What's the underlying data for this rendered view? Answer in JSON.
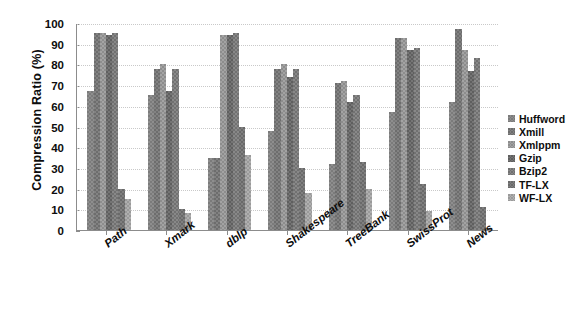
{
  "chart_data": {
    "type": "bar",
    "title": "",
    "xlabel": "",
    "ylabel": "Compression Ratio (%)",
    "ylim": [
      0,
      100
    ],
    "yticks": [
      0,
      10,
      20,
      30,
      40,
      50,
      60,
      70,
      80,
      90,
      100
    ],
    "grid": true,
    "legend_position": "right",
    "categories": [
      "Path",
      "Xmark",
      "dblp",
      "Shakespeare",
      "TreeBank",
      "SwissProt",
      "News"
    ],
    "series": [
      {
        "name": "Huffword",
        "values": [
          67,
          65,
          35,
          48,
          32,
          57,
          62
        ]
      },
      {
        "name": "Xmill",
        "values": [
          95,
          78,
          35,
          78,
          71,
          93,
          97
        ]
      },
      {
        "name": "Xmlppm",
        "values": [
          95,
          80,
          94,
          80,
          72,
          93,
          87
        ]
      },
      {
        "name": "Gzip",
        "values": [
          94,
          67,
          94,
          74,
          62,
          87,
          77
        ]
      },
      {
        "name": "Bzip2",
        "values": [
          95,
          78,
          95,
          78,
          65,
          88,
          83
        ]
      },
      {
        "name": "TF-LX",
        "values": [
          20,
          10,
          50,
          30,
          33,
          22,
          11
        ]
      },
      {
        "name": "WF-LX",
        "values": [
          15,
          8,
          36,
          18,
          20,
          9,
          1
        ]
      }
    ]
  },
  "legend": {
    "items": [
      "Huffword",
      "Xmill",
      "Xmlppm",
      "Gzip",
      "Bzip2",
      "TF-LX",
      "WF-LX"
    ]
  },
  "axis": {
    "y_title": "Compression Ratio (%)",
    "y_tick_labels": [
      "100",
      "90",
      "80",
      "70",
      "60",
      "50",
      "40",
      "30",
      "20",
      "10",
      "0"
    ],
    "x_tick_labels": [
      "Path",
      "Xmark",
      "dblp",
      "Shakespeare",
      "TreeBank",
      "SwissProt",
      "News"
    ]
  }
}
